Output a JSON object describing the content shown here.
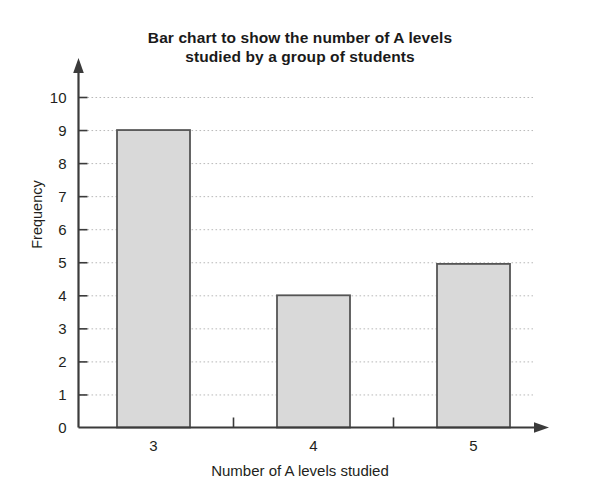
{
  "chart_data": {
    "type": "bar",
    "title": "Bar chart to show the number of A levels studied by a group of students",
    "title_lines": [
      "Bar chart to show the number of A levels",
      "studied by a group of students"
    ],
    "categories": [
      "3",
      "4",
      "5"
    ],
    "values": [
      9,
      4,
      4.95
    ],
    "xlabel": "Number of A levels studied",
    "ylabel": "Frequency",
    "ylim": [
      0,
      10
    ],
    "ytick_labels": [
      "0",
      "1",
      "2",
      "3",
      "4",
      "5",
      "6",
      "7",
      "8",
      "9",
      "10"
    ],
    "ytick_step": 1,
    "grid": true,
    "grid_axis": "y",
    "legend": null,
    "colors": {
      "bar_fill": "#d9d9d9",
      "bar_border": "#555555",
      "axis": "#3b3b3b",
      "gridline": "#b9b9b9",
      "text": "#231f20",
      "background": "#ffffff"
    }
  }
}
